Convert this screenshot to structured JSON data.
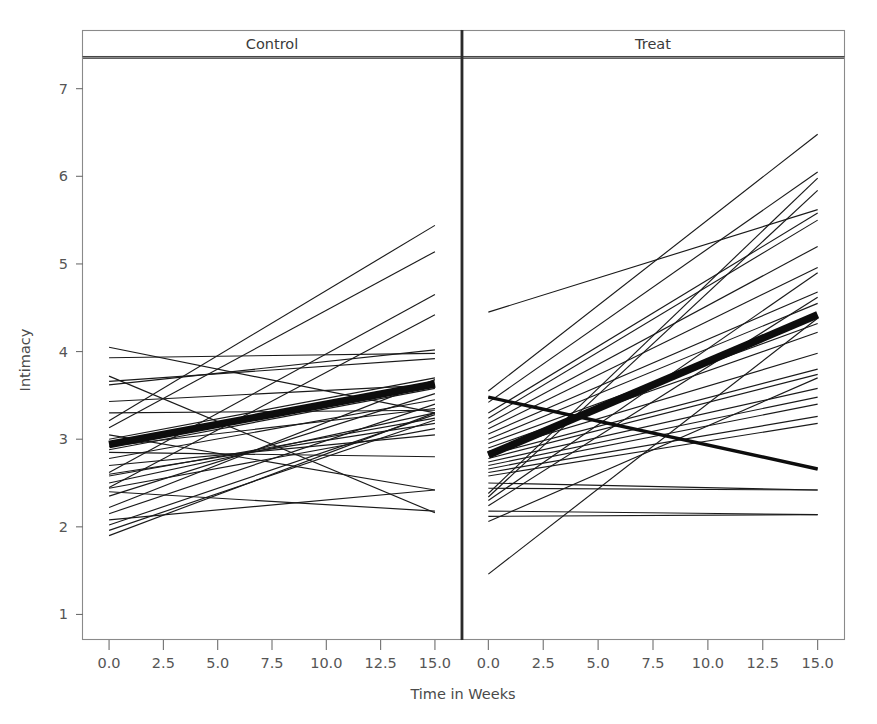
{
  "figure": {
    "title": "",
    "xlabel": "Time in Weeks",
    "ylabel": "Intimacy"
  },
  "panels": [
    {
      "id": "control",
      "label": "Control"
    },
    {
      "id": "treat",
      "label": "Treat"
    }
  ],
  "axes": {
    "x_ticks": [
      "0.0",
      "2.5",
      "5.0",
      "7.5",
      "10.0",
      "12.5",
      "15.0"
    ],
    "y_ticks": [
      "1",
      "2",
      "3",
      "4",
      "5",
      "6",
      "7"
    ]
  },
  "chart_data": {
    "type": "line",
    "title": "",
    "subtitle": "",
    "xlabel": "Time in Weeks",
    "ylabel": "Intimacy",
    "xlim": [
      -1.2,
      16.2
    ],
    "ylim": [
      0.72,
      7.35
    ],
    "xticks": [
      0.0,
      2.5,
      5.0,
      7.5,
      10.0,
      12.5,
      15.0
    ],
    "xticklabels": [
      "0.0",
      "2.5",
      "5.0",
      "7.5",
      "10.0",
      "12.5",
      "15.0"
    ],
    "yticks": [
      1,
      2,
      3,
      4,
      5,
      6,
      7
    ],
    "yticklabels": [
      "1",
      "2",
      "3",
      "4",
      "5",
      "6",
      "7"
    ],
    "grid": false,
    "legend": null,
    "legend_position": "none",
    "facet_variable": "Group",
    "facet_levels": [
      "Control",
      "Treat"
    ],
    "line_color": "#1a1a1a",
    "mean_line_color": "#0d0d0d",
    "x": [
      0,
      15
    ],
    "annotations": [],
    "panels": [
      {
        "name": "Control",
        "description": "Individual subject trajectories, Intimacy vs Time in Weeks, week 0 to week 15. Thick line is the fitted group mean trajectory.",
        "mean_line": {
          "name": "Control mean",
          "x": [
            0,
            15
          ],
          "values": [
            2.94,
            3.63
          ]
        },
        "series": [
          {
            "name": "c01",
            "x": [
              0,
              15
            ],
            "values": [
              4.05,
              3.3
            ]
          },
          {
            "name": "c02",
            "x": [
              0,
              15
            ],
            "values": [
              3.93,
              3.98
            ]
          },
          {
            "name": "c03",
            "x": [
              0,
              15
            ],
            "values": [
              3.72,
              2.16
            ]
          },
          {
            "name": "c04",
            "x": [
              0,
              15
            ],
            "values": [
              3.66,
              3.92
            ]
          },
          {
            "name": "c05",
            "x": [
              0,
              15
            ],
            "values": [
              3.62,
              4.02
            ]
          },
          {
            "name": "c06",
            "x": [
              0,
              15
            ],
            "values": [
              3.43,
              3.62
            ]
          },
          {
            "name": "c07",
            "x": [
              0,
              15
            ],
            "values": [
              3.3,
              3.33
            ]
          },
          {
            "name": "c08",
            "x": [
              0,
              15
            ],
            "values": [
              3.21,
              5.44
            ]
          },
          {
            "name": "c09",
            "x": [
              0,
              15
            ],
            "values": [
              3.13,
              5.14
            ]
          },
          {
            "name": "c10",
            "x": [
              0,
              15
            ],
            "values": [
              3.05,
              2.42
            ]
          },
          {
            "name": "c11",
            "x": [
              0,
              15
            ],
            "values": [
              3.0,
              3.7
            ]
          },
          {
            "name": "c12",
            "x": [
              0,
              15
            ],
            "values": [
              2.92,
              3.35
            ]
          },
          {
            "name": "c13",
            "x": [
              0,
              15
            ],
            "values": [
              2.88,
              3.58
            ]
          },
          {
            "name": "c14",
            "x": [
              0,
              15
            ],
            "values": [
              2.85,
              2.8
            ]
          },
          {
            "name": "c15",
            "x": [
              0,
              15
            ],
            "values": [
              2.78,
              3.45
            ]
          },
          {
            "name": "c16",
            "x": [
              0,
              15
            ],
            "values": [
              2.7,
              3.05
            ]
          },
          {
            "name": "c17",
            "x": [
              0,
              15
            ],
            "values": [
              2.62,
              4.65
            ]
          },
          {
            "name": "c18",
            "x": [
              0,
              15
            ],
            "values": [
              2.58,
              3.24
            ]
          },
          {
            "name": "c19",
            "x": [
              0,
              15
            ],
            "values": [
              2.5,
              3.3
            ]
          },
          {
            "name": "c20",
            "x": [
              0,
              15
            ],
            "values": [
              2.45,
              4.42
            ]
          },
          {
            "name": "c21",
            "x": [
              0,
              15
            ],
            "values": [
              2.44,
              3.12
            ]
          },
          {
            "name": "c22",
            "x": [
              0,
              15
            ],
            "values": [
              2.4,
              2.18
            ]
          },
          {
            "name": "c23",
            "x": [
              0,
              15
            ],
            "values": [
              2.35,
              3.52
            ]
          },
          {
            "name": "c24",
            "x": [
              0,
              15
            ],
            "values": [
              2.22,
              3.68
            ]
          },
          {
            "name": "c25",
            "x": [
              0,
              15
            ],
            "values": [
              2.15,
              3.4
            ]
          },
          {
            "name": "c26",
            "x": [
              0,
              15
            ],
            "values": [
              2.08,
              2.42
            ]
          },
          {
            "name": "c27",
            "x": [
              0,
              15
            ],
            "values": [
              2.02,
              3.28
            ]
          },
          {
            "name": "c28",
            "x": [
              0,
              15
            ],
            "values": [
              1.96,
              3.22
            ]
          },
          {
            "name": "c29",
            "x": [
              0,
              15
            ],
            "values": [
              1.9,
              3.3
            ]
          },
          {
            "name": "c30",
            "x": [
              0,
              15
            ],
            "values": [
              2.6,
              3.18
            ]
          }
        ]
      },
      {
        "name": "Treat",
        "description": "Individual subject trajectories, Intimacy vs Time in Weeks, week 0 to week 15. Thick line is the fitted group mean trajectory.",
        "mean_line": {
          "name": "Treat mean",
          "x": [
            0,
            15
          ],
          "values": [
            2.82,
            4.42
          ]
        },
        "series": [
          {
            "name": "t01",
            "x": [
              0,
              15
            ],
            "values": [
              4.45,
              5.62
            ]
          },
          {
            "name": "t02",
            "x": [
              0,
              15
            ],
            "values": [
              3.55,
              6.48
            ]
          },
          {
            "name": "t03",
            "x": [
              0,
              15
            ],
            "values": [
              3.42,
              6.05
            ]
          },
          {
            "name": "t04",
            "x": [
              0,
              15
            ],
            "values": [
              3.3,
              5.58
            ]
          },
          {
            "name": "t05",
            "x": [
              0,
              15
            ],
            "values": [
              3.24,
              5.5
            ]
          },
          {
            "name": "t06",
            "x": [
              0,
              15
            ],
            "values": [
              3.18,
              5.2
            ]
          },
          {
            "name": "t07",
            "x": [
              0,
              15
            ],
            "values": [
              3.12,
              4.96
            ]
          },
          {
            "name": "t08",
            "x": [
              0,
              15
            ],
            "values": [
              3.06,
              4.68
            ]
          },
          {
            "name": "t09",
            "x": [
              0,
              15
            ],
            "values": [
              3.0,
              4.55
            ]
          },
          {
            "name": "t10",
            "x": [
              0,
              15
            ],
            "values": [
              2.95,
              4.32
            ]
          },
          {
            "name": "t11",
            "x": [
              0,
              15
            ],
            "values": [
              2.9,
              4.22
            ]
          },
          {
            "name": "t12",
            "x": [
              0,
              15
            ],
            "values": [
              2.86,
              3.98
            ]
          },
          {
            "name": "t13",
            "x": [
              0,
              15
            ],
            "values": [
              2.82,
              3.8
            ]
          },
          {
            "name": "t14",
            "x": [
              0,
              15
            ],
            "values": [
              2.78,
              3.74
            ]
          },
          {
            "name": "t15",
            "x": [
              0,
              15
            ],
            "values": [
              2.74,
              3.58
            ]
          },
          {
            "name": "t16",
            "x": [
              0,
              15
            ],
            "values": [
              2.7,
              3.48
            ]
          },
          {
            "name": "t17",
            "x": [
              0,
              15
            ],
            "values": [
              2.66,
              3.4
            ]
          },
          {
            "name": "t18",
            "x": [
              0,
              15
            ],
            "values": [
              2.62,
              3.26
            ]
          },
          {
            "name": "t19",
            "x": [
              0,
              15
            ],
            "values": [
              2.58,
              3.18
            ]
          },
          {
            "name": "t20",
            "x": [
              0,
              15
            ],
            "values": [
              2.5,
              2.42
            ]
          },
          {
            "name": "t21",
            "x": [
              0,
              15
            ],
            "values": [
              2.44,
              2.42
            ]
          },
          {
            "name": "t22",
            "x": [
              0,
              15
            ],
            "values": [
              2.38,
              5.98
            ]
          },
          {
            "name": "t23",
            "x": [
              0,
              15
            ],
            "values": [
              2.3,
              4.9
            ]
          },
          {
            "name": "t24",
            "x": [
              0,
              15
            ],
            "values": [
              2.24,
              4.62
            ]
          },
          {
            "name": "t25",
            "x": [
              0,
              15
            ],
            "values": [
              2.18,
              2.14
            ]
          },
          {
            "name": "t26",
            "x": [
              0,
              15
            ],
            "values": [
              2.12,
              2.14
            ]
          },
          {
            "name": "t27",
            "x": [
              0,
              15
            ],
            "values": [
              2.06,
              3.7
            ]
          },
          {
            "name": "t28",
            "x": [
              0,
              15
            ],
            "values": [
              1.46,
              4.38
            ]
          },
          {
            "name": "t29",
            "x": [
              0,
              15
            ],
            "values": [
              3.48,
              2.66
            ]
          },
          {
            "name": "t30",
            "x": [
              0,
              15
            ],
            "values": [
              2.34,
              5.84
            ]
          }
        ],
        "heavy_series": [
          {
            "name": "t29-declining",
            "x": [
              0,
              15
            ],
            "values": [
              3.48,
              2.66
            ]
          }
        ]
      }
    ]
  }
}
